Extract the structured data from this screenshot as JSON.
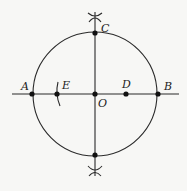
{
  "diagram": {
    "type": "geometric-construction",
    "colors": {
      "line": "#2a2a2a",
      "point": "#111111",
      "background": "#f7f7f5"
    },
    "circle": {
      "center": "O",
      "cx": 95,
      "cy": 94,
      "r": 62
    },
    "points": [
      {
        "id": "A",
        "label": "A",
        "x": 32,
        "y": 94
      },
      {
        "id": "B",
        "label": "B",
        "x": 158,
        "y": 94
      },
      {
        "id": "C",
        "label": "C",
        "x": 95,
        "y": 33
      },
      {
        "id": "O",
        "label": "O",
        "x": 95,
        "y": 94
      },
      {
        "id": "D",
        "label": "D",
        "x": 126,
        "y": 94
      },
      {
        "id": "E",
        "label": "E",
        "x": 57,
        "y": 94
      },
      {
        "id": "bottom",
        "label": "",
        "x": 95,
        "y": 155
      }
    ],
    "labels": {
      "A": "A",
      "B": "B",
      "C": "C",
      "D": "D",
      "E": "E",
      "O": "O"
    }
  }
}
